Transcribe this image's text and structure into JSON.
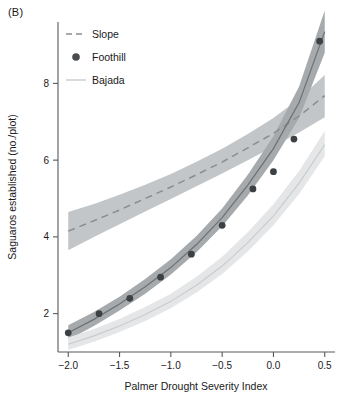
{
  "figure": {
    "panel_label": "(B)",
    "background_color": "#ffffff"
  },
  "chart_data": {
    "type": "line",
    "title": "",
    "subtitle": "",
    "xlabel": "Palmer Drought Severity Index",
    "ylabel": "Saguaros established (no./plot)",
    "xlim": [
      -2.1,
      0.6
    ],
    "ylim": [
      1.0,
      9.6
    ],
    "xticks": [
      -2.0,
      -1.5,
      -1.0,
      -0.5,
      0.0,
      0.5
    ],
    "xticklabels": [
      "−2.0",
      "−1.5",
      "−1.0",
      "−0.5",
      "0.0",
      "0.5"
    ],
    "yticks": [
      2,
      4,
      6,
      8
    ],
    "yticklabels": [
      "2",
      "4",
      "6",
      "8"
    ],
    "grid": false,
    "legend_position": "top-left",
    "legend_entries": [
      {
        "label": "Slope",
        "marker": "dashed-line",
        "color": "#8a8d90"
      },
      {
        "label": "Foothill",
        "marker": "filled-circle",
        "color": "#4a4d50"
      },
      {
        "label": "Bajada",
        "marker": "solid-line",
        "color": "#c9cccd"
      }
    ],
    "series": [
      {
        "name": "Slope",
        "style": "dashed",
        "line_color": "#8a8d90",
        "band_color": "#c3c6c8",
        "x": [
          -2.0,
          -1.75,
          -1.5,
          -1.25,
          -1.0,
          -0.75,
          -0.5,
          -0.25,
          0.0,
          0.25,
          0.5
        ],
        "values": [
          4.15,
          4.42,
          4.7,
          5.0,
          5.3,
          5.62,
          5.95,
          6.32,
          6.7,
          7.15,
          7.68
        ],
        "band_lower": [
          3.65,
          4.0,
          4.33,
          4.66,
          4.99,
          5.32,
          5.65,
          6.0,
          6.35,
          6.72,
          7.12
        ],
        "band_upper": [
          4.65,
          4.86,
          5.1,
          5.36,
          5.64,
          5.96,
          6.3,
          6.68,
          7.1,
          7.6,
          8.22
        ]
      },
      {
        "name": "Foothill",
        "style": "points-with-band",
        "line_color": "#6c7073",
        "band_color": "#a6aaac",
        "point_color": "#3d4144",
        "x": [
          -2.0,
          -1.7,
          -1.4,
          -1.1,
          -0.8,
          -0.5,
          -0.2,
          0.0,
          0.2,
          0.45
        ],
        "values": [
          1.5,
          2.0,
          2.4,
          2.95,
          3.55,
          4.3,
          5.25,
          5.7,
          6.55,
          9.1
        ],
        "curve_x": [
          -2.0,
          -1.75,
          -1.5,
          -1.25,
          -1.0,
          -0.75,
          -0.5,
          -0.25,
          0.0,
          0.25,
          0.5
        ],
        "curve_values": [
          1.5,
          1.85,
          2.25,
          2.7,
          3.2,
          3.8,
          4.5,
          5.35,
          6.3,
          7.5,
          9.35
        ],
        "band_lower": [
          1.32,
          1.68,
          2.08,
          2.52,
          3.02,
          3.6,
          4.28,
          5.08,
          6.0,
          7.1,
          8.8
        ],
        "band_upper": [
          1.7,
          2.04,
          2.44,
          2.9,
          3.42,
          4.02,
          4.74,
          5.62,
          6.62,
          7.92,
          9.9
        ]
      },
      {
        "name": "Bajada",
        "style": "solid",
        "line_color": "#c9cccd",
        "band_color": "#e4e6e7",
        "x": [
          -2.0,
          -1.75,
          -1.5,
          -1.25,
          -1.0,
          -0.75,
          -0.5,
          -0.25,
          0.0,
          0.25,
          0.5
        ],
        "values": [
          1.2,
          1.42,
          1.68,
          1.98,
          2.32,
          2.74,
          3.24,
          3.85,
          4.55,
          5.4,
          6.4
        ],
        "band_lower": [
          1.05,
          1.27,
          1.52,
          1.81,
          2.14,
          2.55,
          3.03,
          3.62,
          4.3,
          5.12,
          6.1
        ],
        "band_upper": [
          1.38,
          1.6,
          1.86,
          2.17,
          2.52,
          2.96,
          3.48,
          4.12,
          4.85,
          5.72,
          6.76
        ]
      }
    ]
  }
}
